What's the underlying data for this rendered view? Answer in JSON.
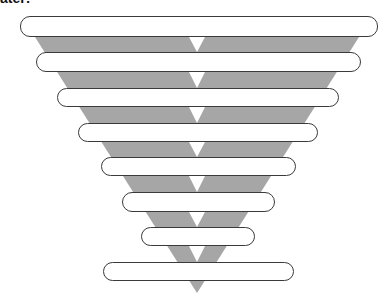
{
  "title": "ater:",
  "colors": {
    "funnel": "#a6a6a6",
    "bar_fill": "#ffffff",
    "bar_border": "#3a3a3a",
    "arrow": "#ffffff"
  },
  "funnel": {
    "top_y": 37,
    "tip": [
      197,
      293
    ],
    "left_top_x": 35,
    "right_top_x": 359,
    "center_x": 197
  },
  "bars": [
    {
      "label": "",
      "left": 20,
      "right": 378,
      "top": 16,
      "bottom": 37
    },
    {
      "label": "",
      "left": 36,
      "right": 361,
      "top": 52,
      "bottom": 72
    },
    {
      "label": "",
      "left": 57,
      "right": 339,
      "top": 88,
      "bottom": 107
    },
    {
      "label": "",
      "left": 78,
      "right": 318,
      "top": 123,
      "bottom": 142
    },
    {
      "label": "",
      "left": 101,
      "right": 296,
      "top": 157,
      "bottom": 176
    },
    {
      "label": "",
      "left": 122,
      "right": 275,
      "top": 192,
      "bottom": 212
    },
    {
      "label": "",
      "left": 141,
      "right": 255,
      "top": 227,
      "bottom": 246
    },
    {
      "label": "",
      "left": 103,
      "right": 294,
      "top": 262,
      "bottom": 281
    }
  ]
}
